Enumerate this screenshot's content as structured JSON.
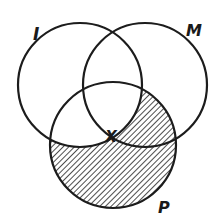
{
  "diagram": {
    "type": "venn",
    "circles": [
      {
        "id": "I",
        "label": "I",
        "cx": 80,
        "cy": 85,
        "r": 62,
        "label_x": 33,
        "label_y": 40
      },
      {
        "id": "M",
        "label": "M",
        "cx": 145,
        "cy": 85,
        "r": 62,
        "label_x": 186,
        "label_y": 36
      },
      {
        "id": "P",
        "label": "P",
        "cx": 113,
        "cy": 145,
        "r": 63,
        "label_x": 158,
        "label_y": 213
      }
    ],
    "region_marker": {
      "label": "X",
      "x": 111,
      "y": 142,
      "region": "I ∩ M ∩ P"
    },
    "shaded_region": "P − I",
    "colors": {
      "stroke": "#1c1c1c",
      "hatch": "#3a3a3a",
      "background": "#ffffff"
    }
  }
}
